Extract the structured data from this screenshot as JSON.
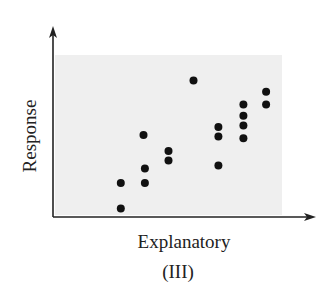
{
  "chart_data": {
    "type": "scatter",
    "title": "",
    "xlabel": "Explanatory",
    "ylabel": "Response",
    "caption": "(III)",
    "grid": false,
    "legend": null,
    "xlim": [
      0,
      10
    ],
    "ylim": [
      0,
      10
    ],
    "ticks": {
      "x": [],
      "y": []
    },
    "points": [
      {
        "x": 2.9,
        "y": 2.0
      },
      {
        "x": 2.9,
        "y": 0.4
      },
      {
        "x": 3.9,
        "y": 5.0
      },
      {
        "x": 3.96,
        "y": 2.9
      },
      {
        "x": 3.96,
        "y": 2.0
      },
      {
        "x": 5.0,
        "y": 4.0
      },
      {
        "x": 5.0,
        "y": 3.4
      },
      {
        "x": 6.1,
        "y": 8.4
      },
      {
        "x": 7.2,
        "y": 5.5
      },
      {
        "x": 7.2,
        "y": 4.9
      },
      {
        "x": 7.2,
        "y": 3.1
      },
      {
        "x": 8.3,
        "y": 6.9
      },
      {
        "x": 8.3,
        "y": 6.2
      },
      {
        "x": 8.3,
        "y": 5.6
      },
      {
        "x": 8.3,
        "y": 4.8
      },
      {
        "x": 9.3,
        "y": 7.7
      },
      {
        "x": 9.3,
        "y": 6.9
      }
    ]
  },
  "colors": {
    "plot_background": "#efefef",
    "axis": "#222222",
    "point": "#111111"
  }
}
